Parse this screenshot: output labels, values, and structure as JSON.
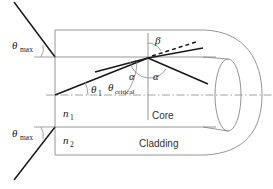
{
  "diagram": {
    "colors": {
      "ray": "#1a1a1a",
      "outline": "#8a8a8a",
      "axis": "#8a8a8a",
      "arc": "#8a8a8a",
      "text": "#1a1a1a",
      "text_plain": "#333333",
      "background": "#ffffff"
    },
    "labels": {
      "theta_max_top": {
        "symbol": "θ",
        "sub": "max"
      },
      "theta_max_bottom": {
        "symbol": "θ",
        "sub": "max"
      },
      "theta_one": {
        "symbol": "θ",
        "sub": "1"
      },
      "theta_critical": {
        "symbol": "θ",
        "sub": "critical"
      },
      "alpha_left": {
        "symbol": "α"
      },
      "alpha_right": {
        "symbol": "α"
      },
      "beta": {
        "symbol": "β"
      },
      "n_one": {
        "symbol": "n",
        "sub": "1"
      },
      "n_two": {
        "symbol": "n",
        "sub": "2"
      },
      "core": "Core",
      "cladding": "Cladding"
    },
    "geometry": {
      "fiber_rect": {
        "x": 55,
        "y": 30,
        "width": 148,
        "height": 125
      },
      "core_top_y": 57,
      "core_bottom_y": 127,
      "axis_y": 95,
      "entry_point": {
        "x": 55,
        "y": 57
      },
      "bottom_entry_point": {
        "x": 55,
        "y": 127
      },
      "reflection_point": {
        "x": 148,
        "y": 58
      },
      "normal_line": {
        "x": 148,
        "y_top": 33,
        "y_bottom": 120
      },
      "end_ellipse": {
        "cx": 228,
        "cy": 95,
        "rx": 13,
        "ry": 36
      },
      "outer_arc_right_x": 262
    }
  }
}
